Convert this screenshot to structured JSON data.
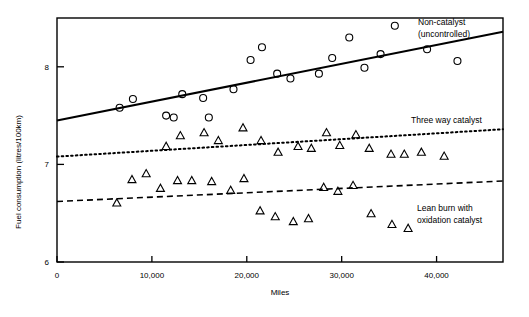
{
  "chart_data": {
    "type": "scatter",
    "title": "",
    "xlabel": "Miles",
    "ylabel": "Fuel consumption (litres/100km)",
    "xlim": [
      0,
      47000
    ],
    "ylim": [
      6,
      8.5
    ],
    "xticks": [
      0,
      10000,
      20000,
      30000,
      40000
    ],
    "xticklabels": [
      "0",
      "10,000",
      "20,000",
      "30,000",
      "40,000"
    ],
    "yticks": [
      6,
      7,
      8
    ],
    "yticklabels": [
      "6",
      "7",
      "8"
    ],
    "grid": false,
    "legend_position": "inline-annotations",
    "series": [
      {
        "name": "Non-catalyst (uncontrolled)",
        "marker": "circle",
        "points": [
          [
            6600,
            7.58
          ],
          [
            8000,
            7.67
          ],
          [
            11500,
            7.5
          ],
          [
            12300,
            7.48
          ],
          [
            13200,
            7.72
          ],
          [
            15400,
            7.68
          ],
          [
            16000,
            7.48
          ],
          [
            18600,
            7.77
          ],
          [
            20400,
            8.07
          ],
          [
            21600,
            8.2
          ],
          [
            23200,
            7.93
          ],
          [
            24600,
            7.88
          ],
          [
            27600,
            7.93
          ],
          [
            29000,
            8.09
          ],
          [
            30800,
            8.3
          ],
          [
            32400,
            7.99
          ],
          [
            34100,
            8.13
          ],
          [
            35600,
            8.42
          ],
          [
            39000,
            8.18
          ],
          [
            42200,
            8.06
          ]
        ]
      },
      {
        "name": "Three way catalyst",
        "marker": "triangle",
        "points": [
          [
            11500,
            7.19
          ],
          [
            13000,
            7.3
          ],
          [
            15500,
            7.33
          ],
          [
            17000,
            7.25
          ],
          [
            19600,
            7.38
          ],
          [
            21500,
            7.25
          ],
          [
            23300,
            7.13
          ],
          [
            25400,
            7.19
          ],
          [
            26800,
            7.17
          ],
          [
            28400,
            7.33
          ],
          [
            29800,
            7.2
          ],
          [
            31500,
            7.31
          ],
          [
            32900,
            7.17
          ],
          [
            35200,
            7.11
          ],
          [
            36600,
            7.11
          ],
          [
            38400,
            7.13
          ],
          [
            40800,
            7.09
          ]
        ]
      },
      {
        "name": "Lean burn with oxidation catalyst",
        "marker": "triangle",
        "points": [
          [
            6300,
            6.61
          ],
          [
            7900,
            6.85
          ],
          [
            9400,
            6.91
          ],
          [
            10900,
            6.76
          ],
          [
            12700,
            6.84
          ],
          [
            14200,
            6.84
          ],
          [
            16300,
            6.83
          ],
          [
            18300,
            6.74
          ],
          [
            19700,
            6.86
          ],
          [
            21400,
            6.53
          ],
          [
            23000,
            6.47
          ],
          [
            24900,
            6.42
          ],
          [
            26500,
            6.45
          ],
          [
            28100,
            6.77
          ],
          [
            29600,
            6.73
          ],
          [
            31200,
            6.79
          ],
          [
            33100,
            6.5
          ],
          [
            35300,
            6.39
          ],
          [
            37000,
            6.35
          ]
        ]
      }
    ],
    "trend_lines": [
      {
        "name": "Non-catalyst trend",
        "style": "solid",
        "x0": 0,
        "y0": 7.45,
        "x1": 47000,
        "y1": 8.36
      },
      {
        "name": "Three way catalyst trend",
        "style": "dotted",
        "x0": 0,
        "y0": 7.08,
        "x1": 47000,
        "y1": 7.36
      },
      {
        "name": "Lean burn trend",
        "style": "dashed",
        "x0": 0,
        "y0": 6.62,
        "x1": 47000,
        "y1": 6.83
      }
    ],
    "annotations": [
      {
        "id": "non-catalyst",
        "line1": "Non-catalyst",
        "line2": "(uncontrolled)"
      },
      {
        "id": "three-way",
        "line1": "Three way catalyst",
        "line2": ""
      },
      {
        "id": "lean-burn",
        "line1": "Lean burn with",
        "line2": "oxidation catalyst"
      }
    ],
    "colors": {
      "ink": "#000000",
      "background": "#ffffff"
    }
  }
}
